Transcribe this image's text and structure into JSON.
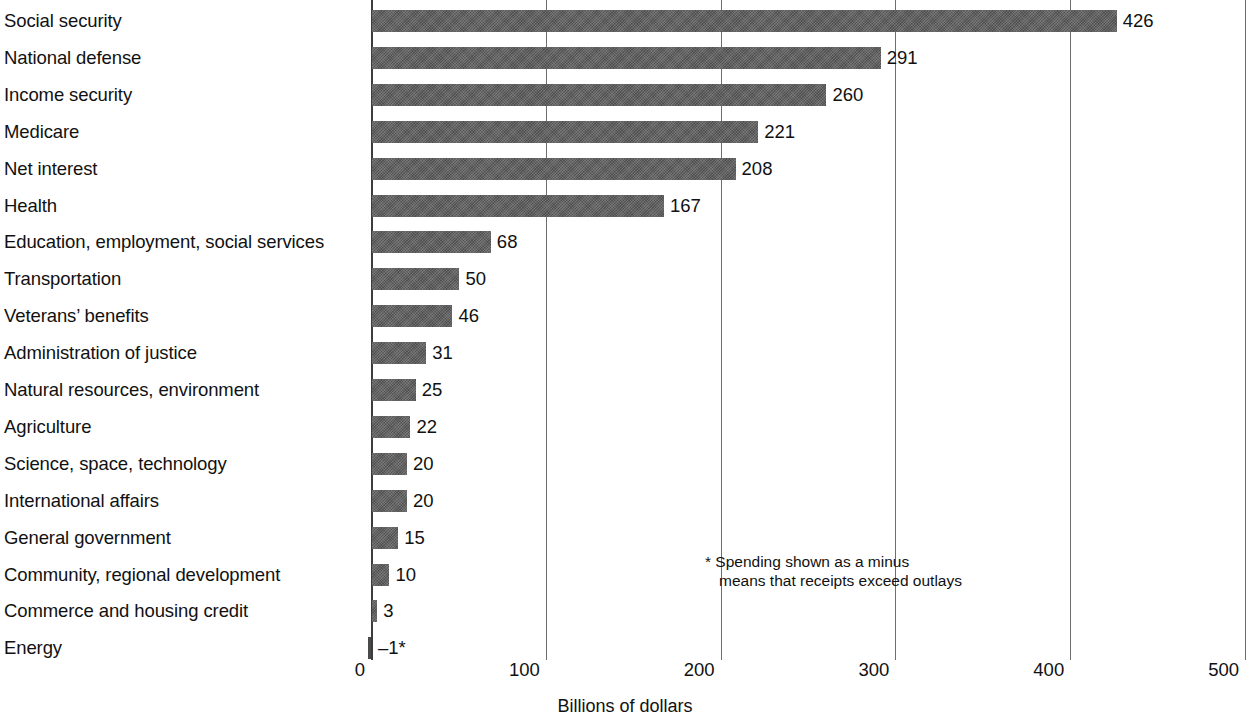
{
  "chart_data": {
    "type": "bar",
    "orientation": "horizontal",
    "title": "",
    "subtitle": "",
    "xlabel": "Billions of dollars",
    "ylabel": "",
    "xlim": [
      0,
      500
    ],
    "xticks": [
      0,
      100,
      200,
      300,
      400,
      500
    ],
    "xtick_labels": [
      "0",
      "100",
      "200",
      "300",
      "400",
      "500"
    ],
    "grid": true,
    "legend": false,
    "legend_position": "none",
    "bar_color": "#5b5b5b",
    "categories": [
      "Social security",
      "National defense",
      "Income security",
      "Medicare",
      "Net interest",
      "Health",
      "Education, employment, social services",
      "Transportation",
      "Veterans’ benefits",
      "Administration of justice",
      "Natural resources, environment",
      "Agriculture",
      "Science, space, technology",
      "International affairs",
      "General government",
      "Community, regional development",
      "Commerce and housing credit",
      "Energy"
    ],
    "values": [
      426,
      291,
      260,
      221,
      208,
      167,
      68,
      50,
      46,
      31,
      25,
      22,
      20,
      20,
      15,
      10,
      3,
      -1
    ],
    "value_labels": [
      "426",
      "291",
      "260",
      "221",
      "208",
      "167",
      "68",
      "50",
      "46",
      "31",
      "25",
      "22",
      "20",
      "20",
      "15",
      "10",
      "3",
      "–1*"
    ],
    "annotations": [
      {
        "name": "minus-footnote",
        "line1": "* Spending shown as a minus",
        "line2": "means that receipts exceed outlays"
      }
    ]
  },
  "axis": {
    "x_title": "Billions of dollars"
  },
  "footnote": {
    "line1": "* Spending shown as a minus",
    "line2": "means that receipts exceed outlays"
  }
}
